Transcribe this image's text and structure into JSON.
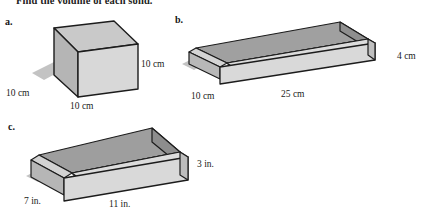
{
  "page": {
    "instruction": "Find the volume of each solid.",
    "background_color": "#ffffff",
    "ink_color": "#1a1a1a"
  },
  "palette": {
    "face_top": "#c9c9c9",
    "face_front": "#d6d6d6",
    "face_left": "#b5b5b5",
    "interior_back": "#9e9e9e",
    "interior_side": "#8f8f8f",
    "interior_floor": "#c2c2c2",
    "rim": "#dcdcdc",
    "outline": "#1c1c1c",
    "shadow": "#b9b9b9"
  },
  "figures": [
    {
      "id": "a",
      "label": "a.",
      "shape_name": "cube",
      "solid_type": "closed-cube",
      "units": "cm",
      "dimensions": [
        {
          "name": "width",
          "value": 10,
          "text": "10 cm"
        },
        {
          "name": "depth",
          "value": 10,
          "text": "10 cm"
        },
        {
          "name": "height",
          "value": 10,
          "text": "10 cm"
        }
      ],
      "labels": {
        "depth_left": "10 cm",
        "width_bottom": "10 cm",
        "height_right": "10 cm"
      }
    },
    {
      "id": "b",
      "label": "b.",
      "shape_name": "open rectangular box",
      "solid_type": "open-box",
      "units": "cm",
      "dimensions": [
        {
          "name": "length",
          "value": 25,
          "text": "25 cm"
        },
        {
          "name": "width",
          "value": 10,
          "text": "10 cm"
        },
        {
          "name": "height",
          "value": 4,
          "text": "4 cm"
        }
      ],
      "labels": {
        "width_left": "10 cm",
        "length_bottom": "25 cm",
        "height_right": "4 cm"
      }
    },
    {
      "id": "c",
      "label": "c.",
      "shape_name": "open rectangular box",
      "solid_type": "open-box",
      "units": "in.",
      "dimensions": [
        {
          "name": "length",
          "value": 11,
          "text": "11 in."
        },
        {
          "name": "width",
          "value": 7,
          "text": "7 in."
        },
        {
          "name": "height",
          "value": 3,
          "text": "3 in."
        }
      ],
      "labels": {
        "width_left": "7 in.",
        "length_bottom": "11 in.",
        "height_right": "3 in."
      }
    }
  ]
}
